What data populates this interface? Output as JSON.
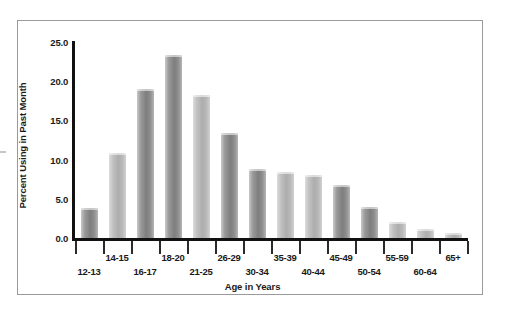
{
  "chart_data": {
    "type": "bar",
    "title": "",
    "xlabel": "Age in Years",
    "ylabel": "Percent Using in Past Month",
    "categories": [
      "12-13",
      "14-15",
      "16-17",
      "18-20",
      "21-25",
      "26-29",
      "30-34",
      "35-39",
      "40-44",
      "45-49",
      "50-54",
      "55-59",
      "60-64",
      "65+"
    ],
    "values": [
      3.8,
      10.9,
      19.0,
      23.3,
      18.3,
      13.4,
      8.8,
      8.4,
      8.1,
      6.8,
      3.9,
      2.0,
      1.1,
      0.6
    ],
    "ylim": [
      0.0,
      25.0
    ],
    "ytick_labels": [
      "0.0",
      "5.0",
      "10.0",
      "15.0",
      "20.0",
      "25.0"
    ],
    "ytick_values": [
      0.0,
      5.0,
      10.0,
      15.0,
      20.0,
      25.0
    ],
    "grid": false,
    "legend": null,
    "bar_shades": [
      "dark",
      "light",
      "dark",
      "dark",
      "light",
      "dark",
      "dark",
      "light",
      "light",
      "dark",
      "dark",
      "light",
      "light",
      "light"
    ],
    "colors": {
      "bar_dark": "#7e7e7e",
      "bar_light": "#adadad",
      "axis": "#111111",
      "text": "#1a1a1a",
      "frame": "#9a9a9e",
      "background": "#ffffff"
    }
  }
}
